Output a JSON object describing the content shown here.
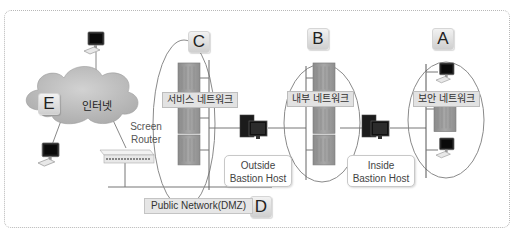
{
  "diagram": {
    "zones": [
      {
        "letter": "A",
        "label": "보안 네트워크"
      },
      {
        "letter": "B",
        "label": "내부 네트워크"
      },
      {
        "letter": "C",
        "label": "서비스 네트워크"
      },
      {
        "letter": "D",
        "label": "Public Network(DMZ)"
      },
      {
        "letter": "E",
        "label": "인터넷"
      }
    ],
    "devices": {
      "screen_router": {
        "line1": "Screen",
        "line2": "Router"
      },
      "outside_bastion": {
        "line1": "Outside",
        "line2": "Bastion Host"
      },
      "inside_bastion": {
        "line1": "Inside",
        "line2": "Bastion Host"
      }
    },
    "colors": {
      "cloud": "#b9b9b9",
      "server": "#9a9a9a",
      "label_bg": "#e2e2e2",
      "line": "#777777"
    }
  }
}
